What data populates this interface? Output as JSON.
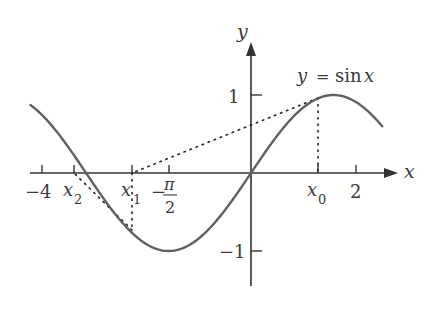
{
  "figure": {
    "function_label": "y = sin x",
    "curve": {
      "function": "sin",
      "x_from": -4.2,
      "x_to": 2.5,
      "color": "#606060"
    },
    "axes": {
      "x_label": "x",
      "y_label": "y",
      "color": "#333333"
    },
    "x_ticks": [
      {
        "value": -4,
        "label": "-4"
      },
      {
        "value": -3.37,
        "label": "x",
        "subscript": "2"
      },
      {
        "value": -2.27,
        "label": "x",
        "subscript": "1"
      },
      {
        "value": -1.5708,
        "label": "π/2",
        "prefix": "−",
        "numerator": "π",
        "denominator": "2"
      },
      {
        "value": 1.27,
        "label": "x",
        "subscript": "0"
      },
      {
        "value": 2,
        "label": "2"
      }
    ],
    "y_ticks": [
      {
        "value": 1,
        "label": "1"
      },
      {
        "value": -1,
        "label": "−1"
      }
    ],
    "labels": {
      "minus4": "−4",
      "two": "2",
      "one": "1",
      "minus_one": "−1",
      "x_var": "x",
      "sub0": "0",
      "sub1": "1",
      "sub2": "2",
      "minus": "−",
      "pi": "π",
      "pi_den": "2",
      "y_eq": "y",
      "eq": "=",
      "sin": "sin",
      "sin_x": "x"
    },
    "construction": {
      "x0": 1.27,
      "x1": -2.27,
      "x2": -3.37,
      "dotted_color": "#222222"
    }
  }
}
